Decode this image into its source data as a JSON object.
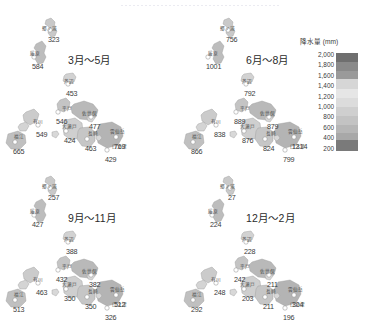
{
  "figure": {
    "region": "長崎県",
    "legend": {
      "title": "降水量 (mm)",
      "ticks": [
        "2,000",
        "1,800",
        "1,600",
        "1,400",
        "1,200",
        "1,000",
        "800",
        "600",
        "400",
        "200"
      ]
    }
  },
  "chart_data": {
    "type": "map",
    "title": "降水量 (mm)",
    "subtype": "small-multiple choropleth with station point labels",
    "unit": "mm",
    "legend_position": "right",
    "colorbar": {
      "scale": "grayscale",
      "ticks": [
        2000,
        1800,
        1600,
        1400,
        1200,
        1000,
        800,
        600,
        400,
        200
      ],
      "vmin": 200,
      "vmax": 2000
    },
    "stations": [
      "郷ノ浦",
      "厳原",
      "芦辺",
      "平戸",
      "佐世保",
      "大瀬戸",
      "有川",
      "福江",
      "長崎",
      "雲仙岳",
      "口之津"
    ],
    "panels": [
      {
        "label": "3月～5月",
        "values": {
          "郷ノ浦": 323,
          "厳原": 584,
          "芦辺": 453,
          "平戸": 546,
          "佐世保": 477,
          "大瀬戸": 424,
          "有川": 549,
          "福江": 665,
          "長崎": 463,
          "雲仙岳": 769,
          "口之津": 429
        }
      },
      {
        "label": "6月～8月",
        "values": {
          "郷ノ浦": 756,
          "厳原": 1001,
          "芦辺": 792,
          "平戸": 889,
          "佐世保": 879,
          "大瀬戸": 876,
          "有川": 838,
          "福江": 866,
          "長崎": 824,
          "雲仙岳": 1314,
          "口之津": 799
        }
      },
      {
        "label": "9月～11月",
        "values": {
          "郷ノ浦": 257,
          "厳原": 427,
          "芦辺": 388,
          "平戸": 432,
          "佐世保": 382,
          "大瀬戸": 350,
          "有川": 463,
          "福江": 513,
          "長崎": 350,
          "雲仙岳": 512,
          "口之津": 326
        }
      },
      {
        "label": "12月～2月",
        "values": {
          "郷ノ浦": 27,
          "厳原": 224,
          "芦辺": 228,
          "平戸": 242,
          "佐世保": 211,
          "大瀬戸": 203,
          "有川": 248,
          "福江": 292,
          "長崎": 211,
          "雲仙岳": 304,
          "口之津": 196
        }
      }
    ]
  },
  "panels": [
    {
      "title": "3月～5月",
      "title_pos": {
        "x": 68,
        "y": 44
      },
      "stations": [
        {
          "name": "郷ノ浦",
          "value": "323",
          "nx": 42,
          "ny": 19,
          "vx": 48,
          "vy": 28
        },
        {
          "name": "厳原",
          "value": "584",
          "nx": 30,
          "ny": 44,
          "vx": 32,
          "vy": 55
        },
        {
          "name": "芦辺",
          "value": "453",
          "nx": 64,
          "ny": 72,
          "vx": 66,
          "vy": 82
        },
        {
          "name": "平戸",
          "value": "546",
          "nx": 62,
          "ny": 99,
          "vx": 56,
          "vy": 110
        },
        {
          "name": "佐世保",
          "value": "477",
          "nx": 82,
          "ny": 104,
          "vx": 89,
          "vy": 115
        },
        {
          "name": "大瀬戸",
          "value": "424",
          "nx": 62,
          "ny": 117,
          "vx": 64,
          "vy": 129
        },
        {
          "name": "有川",
          "value": "549",
          "nx": 33,
          "ny": 112,
          "vx": 36,
          "vy": 123
        },
        {
          "name": "福江",
          "value": "665",
          "nx": 14,
          "ny": 127,
          "vx": 13,
          "vy": 140
        },
        {
          "name": "長崎",
          "value": "463",
          "nx": 88,
          "ny": 124,
          "vx": 85,
          "vy": 137
        },
        {
          "name": "雲仙岳",
          "value": "769",
          "nx": 110,
          "ny": 122,
          "vx": 114,
          "vy": 135
        },
        {
          "name": "口之津",
          "value": "429",
          "nx": 112,
          "ny": 137,
          "vx": 105,
          "vy": 148
        }
      ]
    },
    {
      "title": "6月～8月",
      "title_pos": {
        "x": 68,
        "y": 44
      },
      "stations": [
        {
          "name": "郷ノ浦",
          "value": "756",
          "nx": 42,
          "ny": 19,
          "vx": 48,
          "vy": 28
        },
        {
          "name": "厳原",
          "value": "1001",
          "nx": 30,
          "ny": 44,
          "vx": 28,
          "vy": 55
        },
        {
          "name": "芦辺",
          "value": "792",
          "nx": 64,
          "ny": 72,
          "vx": 66,
          "vy": 82
        },
        {
          "name": "平戸",
          "value": "889",
          "nx": 62,
          "ny": 99,
          "vx": 56,
          "vy": 110
        },
        {
          "name": "佐世保",
          "value": "879",
          "nx": 82,
          "ny": 104,
          "vx": 89,
          "vy": 115
        },
        {
          "name": "大瀬戸",
          "value": "876",
          "nx": 62,
          "ny": 117,
          "vx": 64,
          "vy": 129
        },
        {
          "name": "有川",
          "value": "838",
          "nx": 33,
          "ny": 112,
          "vx": 36,
          "vy": 123
        },
        {
          "name": "福江",
          "value": "866",
          "nx": 14,
          "ny": 127,
          "vx": 13,
          "vy": 140
        },
        {
          "name": "長崎",
          "value": "824",
          "nx": 88,
          "ny": 124,
          "vx": 85,
          "vy": 137
        },
        {
          "name": "雲仙岳",
          "value": "1314",
          "nx": 110,
          "ny": 122,
          "vx": 114,
          "vy": 135
        },
        {
          "name": "口之津",
          "value": "799",
          "nx": 112,
          "ny": 137,
          "vx": 105,
          "vy": 148
        }
      ]
    },
    {
      "title": "9月～11月",
      "title_pos": {
        "x": 68,
        "y": 44
      },
      "stations": [
        {
          "name": "郷ノ浦",
          "value": "257",
          "nx": 42,
          "ny": 19,
          "vx": 48,
          "vy": 28
        },
        {
          "name": "厳原",
          "value": "427",
          "nx": 30,
          "ny": 44,
          "vx": 32,
          "vy": 55
        },
        {
          "name": "芦辺",
          "value": "388",
          "nx": 64,
          "ny": 72,
          "vx": 66,
          "vy": 82
        },
        {
          "name": "平戸",
          "value": "432",
          "nx": 62,
          "ny": 99,
          "vx": 56,
          "vy": 110
        },
        {
          "name": "佐世保",
          "value": "382",
          "nx": 82,
          "ny": 104,
          "vx": 89,
          "vy": 115
        },
        {
          "name": "大瀬戸",
          "value": "350",
          "nx": 62,
          "ny": 117,
          "vx": 64,
          "vy": 129
        },
        {
          "name": "有川",
          "value": "463",
          "nx": 33,
          "ny": 112,
          "vx": 36,
          "vy": 123
        },
        {
          "name": "福江",
          "value": "513",
          "nx": 14,
          "ny": 127,
          "vx": 13,
          "vy": 140
        },
        {
          "name": "長崎",
          "value": "350",
          "nx": 88,
          "ny": 124,
          "vx": 85,
          "vy": 137
        },
        {
          "name": "雲仙岳",
          "value": "512",
          "nx": 110,
          "ny": 122,
          "vx": 114,
          "vy": 135
        },
        {
          "name": "口之津",
          "value": "326",
          "nx": 112,
          "ny": 137,
          "vx": 105,
          "vy": 148
        }
      ]
    },
    {
      "title": "12月～2月",
      "title_pos": {
        "x": 68,
        "y": 44
      },
      "stations": [
        {
          "name": "郷ノ浦",
          "value": "27",
          "nx": 42,
          "ny": 19,
          "vx": 50,
          "vy": 28
        },
        {
          "name": "厳原",
          "value": "224",
          "nx": 30,
          "ny": 44,
          "vx": 32,
          "vy": 55
        },
        {
          "name": "芦辺",
          "value": "228",
          "nx": 64,
          "ny": 72,
          "vx": 66,
          "vy": 82
        },
        {
          "name": "平戸",
          "value": "242",
          "nx": 62,
          "ny": 99,
          "vx": 56,
          "vy": 110
        },
        {
          "name": "佐世保",
          "value": "211",
          "nx": 82,
          "ny": 104,
          "vx": 89,
          "vy": 115
        },
        {
          "name": "大瀬戸",
          "value": "203",
          "nx": 62,
          "ny": 117,
          "vx": 64,
          "vy": 129
        },
        {
          "name": "有川",
          "value": "248",
          "nx": 33,
          "ny": 112,
          "vx": 36,
          "vy": 123
        },
        {
          "name": "福江",
          "value": "292",
          "nx": 14,
          "ny": 127,
          "vx": 13,
          "vy": 140
        },
        {
          "name": "長崎",
          "value": "211",
          "nx": 88,
          "ny": 124,
          "vx": 85,
          "vy": 137
        },
        {
          "name": "雲仙岳",
          "value": "304",
          "nx": 110,
          "ny": 122,
          "vx": 114,
          "vy": 135
        },
        {
          "name": "口之津",
          "value": "196",
          "nx": 112,
          "ny": 137,
          "vx": 105,
          "vy": 148
        }
      ]
    }
  ]
}
